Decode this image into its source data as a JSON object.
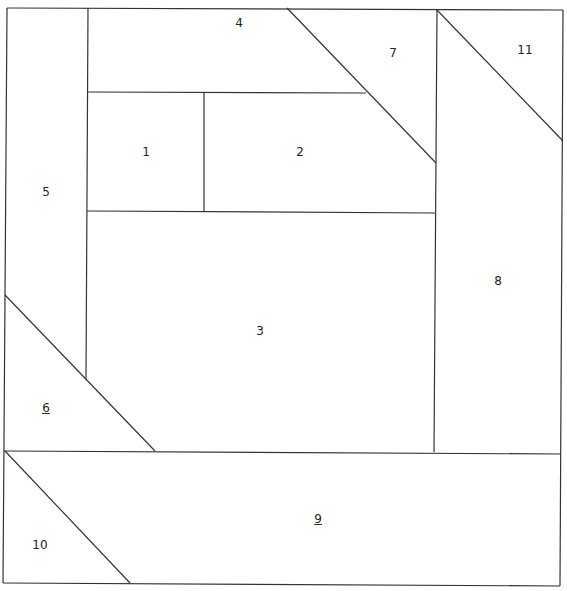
{
  "diagram": {
    "type": "foundation-paper-piecing-pattern",
    "line_color": "#333333",
    "background": "#ffffff",
    "pieces": [
      {
        "id": "1",
        "label": "1",
        "underlined": false,
        "x": 146,
        "y": 152
      },
      {
        "id": "2",
        "label": "2",
        "underlined": false,
        "x": 300,
        "y": 152
      },
      {
        "id": "3",
        "label": "3",
        "underlined": false,
        "x": 260,
        "y": 331
      },
      {
        "id": "4",
        "label": "4",
        "underlined": false,
        "x": 239,
        "y": 23
      },
      {
        "id": "5",
        "label": "5",
        "underlined": false,
        "x": 46,
        "y": 192
      },
      {
        "id": "6",
        "label": "6",
        "underlined": true,
        "x": 46,
        "y": 408
      },
      {
        "id": "7",
        "label": "7",
        "underlined": false,
        "x": 393,
        "y": 53
      },
      {
        "id": "8",
        "label": "8",
        "underlined": false,
        "x": 498,
        "y": 281
      },
      {
        "id": "9",
        "label": "9",
        "underlined": true,
        "x": 318,
        "y": 519
      },
      {
        "id": "10",
        "label": "10",
        "underlined": false,
        "x": 40,
        "y": 545
      },
      {
        "id": "11",
        "label": "11",
        "underlined": false,
        "x": 525,
        "y": 50
      }
    ],
    "lines": [
      {
        "name": "outer-top",
        "x1": 7,
        "y1": 8,
        "x2": 563,
        "y2": 10
      },
      {
        "name": "outer-right",
        "x1": 563,
        "y1": 10,
        "x2": 560,
        "y2": 586
      },
      {
        "name": "outer-bottom",
        "x1": 560,
        "y1": 586,
        "x2": 3,
        "y2": 583
      },
      {
        "name": "outer-left",
        "x1": 3,
        "y1": 583,
        "x2": 7,
        "y2": 8
      },
      {
        "name": "seam-5-right",
        "x1": 88,
        "y1": 8,
        "x2": 86,
        "y2": 379
      },
      {
        "name": "seam-4-bottom",
        "x1": 88,
        "y1": 92,
        "x2": 366,
        "y2": 93
      },
      {
        "name": "seam-1-2",
        "x1": 204,
        "y1": 92,
        "x2": 204,
        "y2": 212
      },
      {
        "name": "seam-12-bottom",
        "x1": 87,
        "y1": 211,
        "x2": 436,
        "y2": 213
      },
      {
        "name": "seam-7-diagonal",
        "x1": 287,
        "y1": 8,
        "x2": 436,
        "y2": 163
      },
      {
        "name": "seam-8-left",
        "x1": 437,
        "y1": 9,
        "x2": 434,
        "y2": 452
      },
      {
        "name": "seam-11-diagonal",
        "x1": 437,
        "y1": 10,
        "x2": 563,
        "y2": 141
      },
      {
        "name": "seam-6-diagonal",
        "x1": 5,
        "y1": 295,
        "x2": 155,
        "y2": 451
      },
      {
        "name": "seam-9-top",
        "x1": 4,
        "y1": 451,
        "x2": 561,
        "y2": 454
      },
      {
        "name": "seam-10-diagonal",
        "x1": 5,
        "y1": 451,
        "x2": 130,
        "y2": 583
      }
    ]
  }
}
